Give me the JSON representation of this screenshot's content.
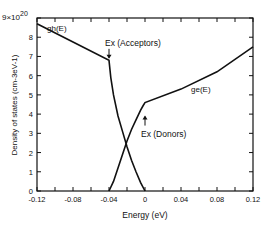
{
  "chart_data": {
    "type": "line",
    "title": "",
    "xlabel": "Energy (eV)",
    "ylabel": "Density of states (cm-3eV-1)",
    "y_multiplier": "x10^20",
    "xlim": [
      -0.12,
      0.12
    ],
    "ylim": [
      0,
      9
    ],
    "x_ticks": [
      "-0.12",
      "-0.08",
      "-0.04",
      "0",
      "0.04",
      "0.08",
      "0.12"
    ],
    "y_ticks": [
      "0",
      "1",
      "2",
      "3",
      "4",
      "5",
      "6",
      "7",
      "8",
      "9"
    ],
    "grid": false,
    "series": [
      {
        "name": "gh(E)",
        "x": [
          -0.12,
          -0.08,
          -0.04,
          -0.038,
          -0.035,
          -0.03,
          -0.025,
          -0.02,
          -0.015,
          -0.01,
          -0.005,
          0.0
        ],
        "y": [
          8.7,
          7.75,
          6.8,
          5.9,
          5.0,
          3.9,
          3.1,
          2.3,
          1.6,
          1.0,
          0.45,
          0.0
        ]
      },
      {
        "name": "ge(E)",
        "x": [
          -0.04,
          -0.035,
          -0.03,
          -0.025,
          -0.02,
          -0.015,
          -0.01,
          -0.005,
          -0.002,
          0.0,
          0.04,
          0.08,
          0.12
        ],
        "y": [
          0.0,
          0.5,
          1.2,
          1.9,
          2.6,
          3.2,
          3.7,
          4.2,
          4.45,
          4.6,
          5.3,
          6.2,
          7.5
        ]
      }
    ],
    "annotations": [
      {
        "text": "gh(E)",
        "x": -0.098,
        "y": 8.3
      },
      {
        "text": "ge(E)",
        "x": 0.062,
        "y": 5.15
      },
      {
        "text": "Ex (Acceptors)",
        "x": -0.04,
        "y": 7.5,
        "arrow": "down"
      },
      {
        "text": "Ex (Donors)",
        "x": 0.0,
        "y": 3.3,
        "arrow": "up"
      }
    ]
  },
  "labels": {
    "y_axis": "Density of states (cm-3eV-1)",
    "x_axis": "Energy (eV)",
    "multiplier_base": "9×10",
    "multiplier_exp": "20",
    "gh": "gh(E)",
    "ge": "ge(E)",
    "acceptors": "Ex (Acceptors)",
    "donors": "Ex (Donors)"
  }
}
